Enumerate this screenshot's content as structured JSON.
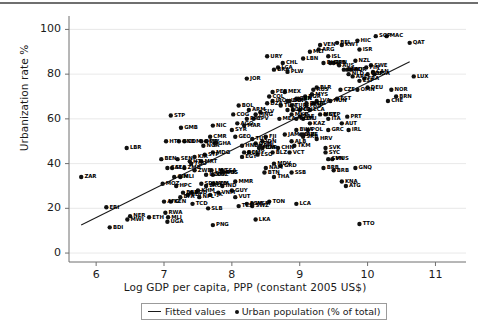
{
  "chart_data": {
    "type": "scatter",
    "title": "",
    "xlabel": "Log GDP per capita, PPP (constant 2005 US$)",
    "ylabel": "Urbanization rate %",
    "xlim": [
      5.6,
      11.45
    ],
    "ylim": [
      -4,
      106
    ],
    "xticks": [
      6,
      7,
      8,
      9,
      10,
      11
    ],
    "yticks": [
      0,
      20,
      40,
      60,
      80,
      100
    ],
    "grid": true,
    "legend_position": "below-axis",
    "legend": [
      {
        "marker": "line",
        "label": "Fitted values"
      },
      {
        "marker": "dot",
        "label": "Urban population (% of total)"
      }
    ],
    "fit_line": {
      "x0": 5.78,
      "y0": 12.5,
      "x1": 10.62,
      "y1": 85.5
    },
    "point_label_key": "ISO3 country code",
    "points": [
      {
        "label": "ZAR",
        "x": 5.78,
        "y": 34
      },
      {
        "label": "LBR",
        "x": 6.45,
        "y": 47
      },
      {
        "label": "ERI",
        "x": 6.15,
        "y": 20.5
      },
      {
        "label": "BDI",
        "x": 6.2,
        "y": 11.5
      },
      {
        "label": "HTI",
        "x": 7.03,
        "y": 50
      },
      {
        "label": "STP",
        "x": 7.1,
        "y": 61.5
      },
      {
        "label": "GMB",
        "x": 7.25,
        "y": 56
      },
      {
        "label": "GNB",
        "x": 7.22,
        "y": 50
      },
      {
        "label": "COM",
        "x": 7.3,
        "y": 50
      },
      {
        "label": "BEN",
        "x": 6.96,
        "y": 42
      },
      {
        "label": "SEN",
        "x": 7.2,
        "y": 42
      },
      {
        "label": "KIR",
        "x": 7.45,
        "y": 43
      },
      {
        "label": "HTI2",
        "x": 7.38,
        "y": 41
      },
      {
        "label": "SLE",
        "x": 7.12,
        "y": 38
      },
      {
        "label": "ZMB",
        "x": 7.3,
        "y": 38
      },
      {
        "label": "GIN",
        "x": 7.15,
        "y": 34
      },
      {
        "label": "MLI",
        "x": 7.24,
        "y": 34
      },
      {
        "label": "MOZ",
        "x": 6.98,
        "y": 31
      },
      {
        "label": "HPC",
        "x": 7.18,
        "y": 30
      },
      {
        "label": "NER",
        "x": 6.5,
        "y": 16.5
      },
      {
        "label": "MWI",
        "x": 6.46,
        "y": 15
      },
      {
        "label": "ETH",
        "x": 6.78,
        "y": 16
      },
      {
        "label": "RWA",
        "x": 7.02,
        "y": 18
      },
      {
        "label": "MLI2",
        "x": 7.06,
        "y": 16
      },
      {
        "label": "UGA",
        "x": 7.05,
        "y": 14
      },
      {
        "label": "AFG",
        "x": 7.0,
        "y": 23
      },
      {
        "label": "KEN",
        "x": 7.1,
        "y": 23
      },
      {
        "label": "TCD",
        "x": 7.42,
        "y": 22
      },
      {
        "label": "SLB",
        "x": 7.65,
        "y": 20
      },
      {
        "label": "BRB2",
        "x": 7.28,
        "y": 27
      },
      {
        "label": "BFA",
        "x": 7.24,
        "y": 25
      },
      {
        "label": "BDI2",
        "x": 7.35,
        "y": 26
      },
      {
        "label": "NGA",
        "x": 7.58,
        "y": 48
      },
      {
        "label": "OMR",
        "x": 7.55,
        "y": 50
      },
      {
        "label": "NIC",
        "x": 7.72,
        "y": 57
      },
      {
        "label": "MDG",
        "x": 7.72,
        "y": 45
      },
      {
        "label": "PNG",
        "x": 7.72,
        "y": 12.5
      },
      {
        "label": "SDN",
        "x": 7.55,
        "y": 31
      },
      {
        "label": "LVO",
        "x": 7.72,
        "y": 31
      },
      {
        "label": "KHM",
        "x": 7.5,
        "y": 28
      },
      {
        "label": "LMC",
        "x": 7.7,
        "y": 37
      },
      {
        "label": "UZB",
        "x": 7.62,
        "y": 35
      },
      {
        "label": "PSS",
        "x": 7.88,
        "y": 36
      },
      {
        "label": "GUY",
        "x": 8.0,
        "y": 28
      },
      {
        "label": "NPL",
        "x": 7.52,
        "y": 25
      },
      {
        "label": "VNM",
        "x": 7.8,
        "y": 27
      },
      {
        "label": "MMR",
        "x": 8.05,
        "y": 32
      },
      {
        "label": "IND",
        "x": 7.86,
        "y": 30
      },
      {
        "label": "FSM",
        "x": 8.22,
        "y": 22
      },
      {
        "label": "TLS",
        "x": 8.1,
        "y": 21
      },
      {
        "label": "LKA",
        "x": 8.35,
        "y": 15
      },
      {
        "label": "SWZ",
        "x": 8.3,
        "y": 21
      },
      {
        "label": "BOL",
        "x": 8.1,
        "y": 66
      },
      {
        "label": "COG",
        "x": 8.02,
        "y": 62
      },
      {
        "label": "ARM",
        "x": 8.25,
        "y": 64
      },
      {
        "label": "PRY",
        "x": 8.22,
        "y": 60
      },
      {
        "label": "AGO",
        "x": 8.08,
        "y": 58
      },
      {
        "label": "SYR",
        "x": 8.0,
        "y": 55
      },
      {
        "label": "GEO",
        "x": 8.05,
        "y": 52
      },
      {
        "label": "MAR",
        "x": 8.18,
        "y": 57
      },
      {
        "label": "EGY",
        "x": 8.15,
        "y": 43
      },
      {
        "label": "LSO",
        "x": 8.38,
        "y": 44
      },
      {
        "label": "LMY",
        "x": 8.25,
        "y": 45
      },
      {
        "label": "MDA",
        "x": 8.4,
        "y": 47
      },
      {
        "label": "NAM",
        "x": 8.5,
        "y": 38
      },
      {
        "label": "BTN",
        "x": 8.48,
        "y": 36
      },
      {
        "label": "MDV",
        "x": 8.62,
        "y": 40
      },
      {
        "label": "GRD",
        "x": 8.72,
        "y": 39
      },
      {
        "label": "THA",
        "x": 8.62,
        "y": 34
      },
      {
        "label": "JOR",
        "x": 8.22,
        "y": 78
      },
      {
        "label": "DZA",
        "x": 8.52,
        "y": 67
      },
      {
        "label": "PER",
        "x": 8.6,
        "y": 72
      },
      {
        "label": "COL",
        "x": 8.55,
        "y": 70
      },
      {
        "label": "MEX",
        "x": 8.78,
        "y": 72
      },
      {
        "label": "TUN",
        "x": 8.72,
        "y": 66
      },
      {
        "label": "URY",
        "x": 8.52,
        "y": 88
      },
      {
        "label": "CHL",
        "x": 8.75,
        "y": 85
      },
      {
        "label": "BRA",
        "x": 8.62,
        "y": 82
      },
      {
        "label": "PLW",
        "x": 8.82,
        "y": 81
      },
      {
        "label": "LCA2",
        "x": 8.68,
        "y": 83
      },
      {
        "label": "UMC",
        "x": 8.9,
        "y": 64
      },
      {
        "label": "TUR",
        "x": 8.88,
        "y": 66
      },
      {
        "label": "MKD",
        "x": 8.88,
        "y": 62
      },
      {
        "label": "BWA",
        "x": 8.95,
        "y": 55
      },
      {
        "label": "ROM",
        "x": 8.95,
        "y": 60
      },
      {
        "label": "LTU",
        "x": 9.05,
        "y": 60
      },
      {
        "label": "POL",
        "x": 9.12,
        "y": 55
      },
      {
        "label": "BIH",
        "x": 9.02,
        "y": 53
      },
      {
        "label": "VCT",
        "x": 8.85,
        "y": 45
      },
      {
        "label": "HRV",
        "x": 9.25,
        "y": 51
      },
      {
        "label": "SVK",
        "x": 9.38,
        "y": 47
      },
      {
        "label": "SYC",
        "x": 9.38,
        "y": 45
      },
      {
        "label": "SVN",
        "x": 9.42,
        "y": 42
      },
      {
        "label": "BRB",
        "x": 9.5,
        "y": 37
      },
      {
        "label": "GNQ",
        "x": 9.82,
        "y": 38
      },
      {
        "label": "KNA",
        "x": 9.62,
        "y": 32
      },
      {
        "label": "ATG",
        "x": 9.68,
        "y": 30
      },
      {
        "label": "LCA3",
        "x": 8.95,
        "y": 22
      },
      {
        "label": "TTO",
        "x": 9.88,
        "y": 13
      },
      {
        "label": "SSB",
        "x": 8.88,
        "y": 36
      },
      {
        "label": "GRC",
        "x": 9.42,
        "y": 55
      },
      {
        "label": "CYP",
        "x": 9.38,
        "y": 62
      },
      {
        "label": "ITA",
        "x": 9.42,
        "y": 60
      },
      {
        "label": "AUT",
        "x": 9.62,
        "y": 58
      },
      {
        "label": "IRL",
        "x": 9.72,
        "y": 55
      },
      {
        "label": "BHR",
        "x": 9.35,
        "y": 85
      },
      {
        "label": "MLT",
        "x": 9.15,
        "y": 90
      },
      {
        "label": "ISL",
        "x": 9.42,
        "y": 88
      },
      {
        "label": "JPN",
        "x": 9.5,
        "y": 85
      },
      {
        "label": "AUS",
        "x": 9.58,
        "y": 84
      },
      {
        "label": "BEL",
        "x": 9.55,
        "y": 94
      },
      {
        "label": "KWT",
        "x": 9.62,
        "y": 93
      },
      {
        "label": "DNK",
        "x": 9.65,
        "y": 82
      },
      {
        "label": "NLD",
        "x": 9.72,
        "y": 80
      },
      {
        "label": "ARE",
        "x": 9.78,
        "y": 79
      },
      {
        "label": "HIC",
        "x": 9.85,
        "y": 95
      },
      {
        "label": "SGP",
        "x": 10.12,
        "y": 97
      },
      {
        "label": "MAC",
        "x": 10.28,
        "y": 97
      },
      {
        "label": "QAT",
        "x": 10.62,
        "y": 94
      },
      {
        "label": "NOR",
        "x": 10.35,
        "y": 73
      },
      {
        "label": "BRN",
        "x": 10.42,
        "y": 70
      },
      {
        "label": "CHE",
        "x": 10.3,
        "y": 68
      },
      {
        "label": "LUX",
        "x": 10.68,
        "y": 79
      },
      {
        "label": "USA",
        "x": 10.1,
        "y": 80
      },
      {
        "label": "GBR",
        "x": 10.0,
        "y": 80
      },
      {
        "label": "SWE",
        "x": 10.05,
        "y": 84
      },
      {
        "label": "FIN",
        "x": 9.98,
        "y": 83
      },
      {
        "label": "ESP",
        "x": 9.88,
        "y": 77
      },
      {
        "label": "FRA",
        "x": 9.95,
        "y": 78
      },
      {
        "label": "DEU",
        "x": 10.0,
        "y": 74
      },
      {
        "label": "CAN",
        "x": 10.08,
        "y": 81
      },
      {
        "label": "NZL",
        "x": 9.82,
        "y": 86
      },
      {
        "label": "KOR",
        "x": 9.75,
        "y": 82
      },
      {
        "label": "PRT",
        "x": 9.7,
        "y": 61
      },
      {
        "label": "EST",
        "x": 9.55,
        "y": 69
      },
      {
        "label": "CZE",
        "x": 9.6,
        "y": 73
      },
      {
        "label": "HUN",
        "x": 9.45,
        "y": 68
      },
      {
        "label": "RUS",
        "x": 9.2,
        "y": 73
      },
      {
        "label": "BLR",
        "x": 9.25,
        "y": 74
      },
      {
        "label": "MYS",
        "x": 9.18,
        "y": 71
      },
      {
        "label": "LBN",
        "x": 9.05,
        "y": 87
      },
      {
        "label": "ARG",
        "x": 9.28,
        "y": 91
      },
      {
        "label": "VEN",
        "x": 9.3,
        "y": 93
      },
      {
        "label": "SAU",
        "x": 9.7,
        "y": 82
      },
      {
        "label": "ISR",
        "x": 9.88,
        "y": 91
      },
      {
        "label": "OMN",
        "x": 9.85,
        "y": 73
      },
      {
        "label": "ITA2",
        "x": 9.2,
        "y": 67
      },
      {
        "label": "ZAF",
        "x": 9.0,
        "y": 61
      },
      {
        "label": "IRN",
        "x": 8.98,
        "y": 69
      },
      {
        "label": "CRI",
        "x": 9.0,
        "y": 64
      },
      {
        "label": "PAN",
        "x": 9.1,
        "y": 66
      },
      {
        "label": "BGR",
        "x": 9.08,
        "y": 70
      },
      {
        "label": "LVA",
        "x": 9.25,
        "y": 68
      },
      {
        "label": "KAZ",
        "x": 9.15,
        "y": 58
      },
      {
        "label": "SRB",
        "x": 9.05,
        "y": 52
      },
      {
        "label": "ALB",
        "x": 8.88,
        "y": 50
      },
      {
        "label": "UKR",
        "x": 8.82,
        "y": 68
      },
      {
        "label": "JAM",
        "x": 8.78,
        "y": 53
      },
      {
        "label": "ECU",
        "x": 8.82,
        "y": 64
      },
      {
        "label": "DOM",
        "x": 8.85,
        "y": 68
      },
      {
        "label": "TKM",
        "x": 8.92,
        "y": 48
      },
      {
        "label": "IDN",
        "x": 8.45,
        "y": 50
      },
      {
        "label": "PHL",
        "x": 8.42,
        "y": 48
      },
      {
        "label": "CHN",
        "x": 8.68,
        "y": 47
      },
      {
        "label": "CPV",
        "x": 8.32,
        "y": 60
      },
      {
        "label": "BLZ",
        "x": 8.6,
        "y": 45
      },
      {
        "label": "FJI",
        "x": 8.5,
        "y": 52
      },
      {
        "label": "SUR",
        "x": 8.95,
        "y": 69
      },
      {
        "label": "GTM",
        "x": 8.35,
        "y": 49
      },
      {
        "label": "HND",
        "x": 8.15,
        "y": 48
      },
      {
        "label": "SLV",
        "x": 8.42,
        "y": 63
      },
      {
        "label": "MNG",
        "x": 8.35,
        "y": 62
      },
      {
        "label": "GAB",
        "x": 9.45,
        "y": 85
      },
      {
        "label": "MUS",
        "x": 9.48,
        "y": 42
      },
      {
        "label": "DMA",
        "x": 9.1,
        "y": 67
      },
      {
        "label": "TON",
        "x": 8.55,
        "y": 23
      },
      {
        "label": "WSM",
        "x": 8.3,
        "y": 22
      },
      {
        "label": "VUT",
        "x": 8.05,
        "y": 25
      },
      {
        "label": "PAK",
        "x": 7.85,
        "y": 36
      },
      {
        "label": "BGD",
        "x": 7.4,
        "y": 27
      },
      {
        "label": "LAO",
        "x": 7.62,
        "y": 30
      },
      {
        "label": "YEM",
        "x": 7.72,
        "y": 31
      },
      {
        "label": "MRT",
        "x": 7.55,
        "y": 41
      },
      {
        "label": "CMR",
        "x": 7.68,
        "y": 52
      },
      {
        "label": "CIV",
        "x": 7.62,
        "y": 50
      },
      {
        "label": "GHA",
        "x": 7.75,
        "y": 49
      },
      {
        "label": "TGO",
        "x": 7.4,
        "y": 40
      },
      {
        "label": "ZWE",
        "x": 7.45,
        "y": 37
      },
      {
        "label": "STP2",
        "x": 7.6,
        "y": 44
      },
      {
        "label": "TJK",
        "x": 7.68,
        "y": 26
      },
      {
        "label": "KGZ",
        "x": 7.72,
        "y": 35
      },
      {
        "label": "CAF",
        "x": 7.05,
        "y": 38
      },
      {
        "label": "BOL2",
        "x": 8.18,
        "y": 45
      },
      {
        "label": "IRQ",
        "x": 8.6,
        "y": 68
      },
      {
        "label": "BRB3",
        "x": 9.35,
        "y": 38
      },
      {
        "label": "SSA",
        "x": 7.85,
        "y": 37
      },
      {
        "label": "MNE",
        "x": 9.3,
        "y": 62
      },
      {
        "label": "AZE",
        "x": 9.05,
        "y": 53
      },
      {
        "label": "TUV",
        "x": 8.3,
        "y": 51
      },
      {
        "label": "EAP",
        "x": 8.45,
        "y": 47
      },
      {
        "label": "ECA",
        "x": 9.15,
        "y": 64
      },
      {
        "label": "MEA",
        "x": 8.7,
        "y": 60
      }
    ]
  },
  "axes": {
    "y_tick_labels": [
      "100",
      "80",
      "60",
      "40",
      "20",
      "0"
    ],
    "x_tick_labels": [
      "6",
      "7",
      "8",
      "9",
      "10",
      "11"
    ]
  },
  "colors": {
    "point": "#111111",
    "line": "#1a1a1a",
    "grid": "#e2e2e2",
    "axis": "#6f6f6f",
    "top_rule": "#6f6f6f"
  }
}
